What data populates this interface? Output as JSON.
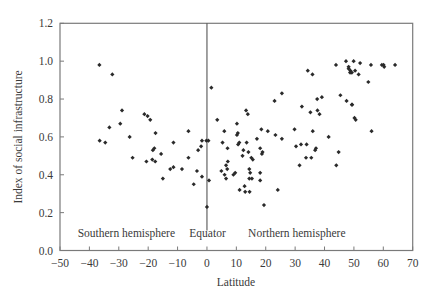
{
  "chart_data": {
    "type": "scatter",
    "title": "",
    "xlabel": "Latitude",
    "ylabel": "Index of social infrastructure",
    "xlim": [
      -50,
      70
    ],
    "ylim": [
      0.0,
      1.2
    ],
    "xticks": [
      -50,
      -40,
      -30,
      -20,
      -10,
      0,
      10,
      20,
      30,
      40,
      50,
      60,
      70
    ],
    "xtick_labels": [
      "−50",
      "−40",
      "−30",
      "−20",
      "−10",
      "0",
      "10",
      "20",
      "30",
      "40",
      "50",
      "60",
      "70"
    ],
    "yticks": [
      0.0,
      0.2,
      0.4,
      0.6,
      0.8,
      1.0,
      1.2
    ],
    "ytick_labels": [
      "0.0",
      "0.2",
      "0.4",
      "0.6",
      "0.8",
      "1.0",
      "1.2"
    ],
    "grid": false,
    "legend": null,
    "reference_line": {
      "x": 0,
      "label": "Equator"
    },
    "annotations": [
      {
        "text": "Southern hemisphere",
        "x": -44,
        "y": 0.07
      },
      {
        "text": "Equator",
        "x": -6,
        "y": 0.07
      },
      {
        "text": "Northern hemisphere",
        "x": 14,
        "y": 0.07
      }
    ],
    "marker_color": "#2a2a2a",
    "series": [
      {
        "name": "Countries",
        "points": [
          [
            -36.6,
            0.98
          ],
          [
            -32.2,
            0.93
          ],
          [
            -28.9,
            0.74
          ],
          [
            -29.5,
            0.67
          ],
          [
            -33.2,
            0.65
          ],
          [
            -26.3,
            0.6
          ],
          [
            -36.5,
            0.58
          ],
          [
            -34.6,
            0.57
          ],
          [
            -25.3,
            0.49
          ],
          [
            -21.3,
            0.72
          ],
          [
            -20.2,
            0.71
          ],
          [
            -19.3,
            0.69
          ],
          [
            -17.5,
            0.62
          ],
          [
            -6.3,
            0.63
          ],
          [
            -11.4,
            0.57
          ],
          [
            -17.9,
            0.54
          ],
          [
            -18.4,
            0.53
          ],
          [
            -15.6,
            0.51
          ],
          [
            -20.6,
            0.47
          ],
          [
            -18.6,
            0.48
          ],
          [
            -17.6,
            0.47
          ],
          [
            -6.3,
            0.49
          ],
          [
            -1.7,
            0.58
          ],
          [
            -2.0,
            0.55
          ],
          [
            -3.0,
            0.53
          ],
          [
            -0.2,
            0.58
          ],
          [
            0.5,
            0.58
          ],
          [
            -11.4,
            0.44
          ],
          [
            -12.5,
            0.43
          ],
          [
            -8.5,
            0.43
          ],
          [
            -3.4,
            0.42
          ],
          [
            -15.0,
            0.38
          ],
          [
            -1.7,
            0.39
          ],
          [
            -4.5,
            0.35
          ],
          [
            0.0,
            0.23
          ],
          [
            0.7,
            0.37
          ],
          [
            1.5,
            0.86
          ],
          [
            23.0,
            0.79
          ],
          [
            13.3,
            0.74
          ],
          [
            13.9,
            0.72
          ],
          [
            3.5,
            0.69
          ],
          [
            10.2,
            0.67
          ],
          [
            5.9,
            0.63
          ],
          [
            18.5,
            0.64
          ],
          [
            20.7,
            0.63
          ],
          [
            10.5,
            0.62
          ],
          [
            10.2,
            0.61
          ],
          [
            23.3,
            0.61
          ],
          [
            17.0,
            0.59
          ],
          [
            13.5,
            0.57
          ],
          [
            5.3,
            0.57
          ],
          [
            11.0,
            0.57
          ],
          [
            10.6,
            0.56
          ],
          [
            7.0,
            0.54
          ],
          [
            18.1,
            0.54
          ],
          [
            12.4,
            0.53
          ],
          [
            14.1,
            0.52
          ],
          [
            18.9,
            0.52
          ],
          [
            12.1,
            0.5
          ],
          [
            18.7,
            0.51
          ],
          [
            15.1,
            0.49
          ],
          [
            15.6,
            0.48
          ],
          [
            7.1,
            0.47
          ],
          [
            6.5,
            0.45
          ],
          [
            6.9,
            0.43
          ],
          [
            4.9,
            0.42
          ],
          [
            14.4,
            0.43
          ],
          [
            9.6,
            0.41
          ],
          [
            9.0,
            0.4
          ],
          [
            14.7,
            0.41
          ],
          [
            18.1,
            0.41
          ],
          [
            6.0,
            0.4
          ],
          [
            6.5,
            0.38
          ],
          [
            15.3,
            0.38
          ],
          [
            14.4,
            0.38
          ],
          [
            18.1,
            0.37
          ],
          [
            12.8,
            0.34
          ],
          [
            11.1,
            0.32
          ],
          [
            13.0,
            0.31
          ],
          [
            14.5,
            0.31
          ],
          [
            24.1,
            0.32
          ],
          [
            19.4,
            0.24
          ],
          [
            34.3,
            0.95
          ],
          [
            35.9,
            0.93
          ],
          [
            43.9,
            0.98
          ],
          [
            47.3,
            1.0
          ],
          [
            48.2,
            0.97
          ],
          [
            48.8,
            0.95
          ],
          [
            49.3,
            0.94
          ],
          [
            25.5,
            0.83
          ],
          [
            39.1,
            0.81
          ],
          [
            37.5,
            0.8
          ],
          [
            45.4,
            0.82
          ],
          [
            47.5,
            0.79
          ],
          [
            49.3,
            0.77
          ],
          [
            32.3,
            0.76
          ],
          [
            37.6,
            0.74
          ],
          [
            35.2,
            0.73
          ],
          [
            38.3,
            0.72
          ],
          [
            50.2,
            0.7
          ],
          [
            29.8,
            0.64
          ],
          [
            36.0,
            0.63
          ],
          [
            41.4,
            0.6
          ],
          [
            25.5,
            0.59
          ],
          [
            30.3,
            0.55
          ],
          [
            32.0,
            0.56
          ],
          [
            33.9,
            0.56
          ],
          [
            37.1,
            0.54
          ],
          [
            36.8,
            0.53
          ],
          [
            44.8,
            0.52
          ],
          [
            33.7,
            0.49
          ],
          [
            35.5,
            0.49
          ],
          [
            31.5,
            0.45
          ],
          [
            44.0,
            0.45
          ],
          [
            49.9,
            1.0
          ],
          [
            52.1,
            0.99
          ],
          [
            55.8,
            0.98
          ],
          [
            59.5,
            0.98
          ],
          [
            60.1,
            0.98
          ],
          [
            60.3,
            0.97
          ],
          [
            64.0,
            0.98
          ],
          [
            48.2,
            0.96
          ],
          [
            48.7,
            0.94
          ],
          [
            50.4,
            0.95
          ],
          [
            51.6,
            0.93
          ],
          [
            54.9,
            0.89
          ],
          [
            49.4,
            0.77
          ],
          [
            50.6,
            0.69
          ],
          [
            56.0,
            0.63
          ]
        ]
      }
    ]
  }
}
